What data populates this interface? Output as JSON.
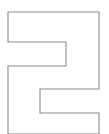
{
  "canvas": {
    "width": 109,
    "height": 134,
    "background_color": "#ffffff"
  },
  "figure": {
    "name": "zigzag-outline-polygon",
    "stroke_color": "#8c8c8c",
    "fill_color": "#ffffff",
    "stroke_width": 1.1,
    "clipped_at_bottom": true,
    "vertices": [
      [
        8,
        12
      ],
      [
        99,
        12
      ],
      [
        99,
        89
      ],
      [
        40,
        89
      ],
      [
        40,
        113
      ],
      [
        99,
        113
      ],
      [
        99,
        134
      ],
      [
        8,
        134
      ],
      [
        8,
        66
      ],
      [
        66,
        66
      ],
      [
        66,
        42
      ],
      [
        8,
        42
      ]
    ],
    "path_d": "M 8 12 L 99 12 L 99 89 L 40 89 L 40 113 L 99 113 L 99 134 L 8 134 L 8 66 L 66 66 L 66 42 L 8 42 Z"
  }
}
